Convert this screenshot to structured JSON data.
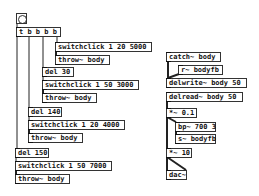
{
  "patch": {
    "bang": {
      "label": "bng"
    },
    "objects": [
      {
        "id": "trigger",
        "text": "t b b b b",
        "x": 16,
        "y": 27,
        "w": 45
      },
      {
        "id": "switchclick1",
        "text": "switchclick 1 20 5000",
        "x": 55,
        "y": 42,
        "w": 97
      },
      {
        "id": "throw1",
        "text": "throw~ body",
        "x": 55,
        "y": 55,
        "w": 55
      },
      {
        "id": "del30",
        "text": "del 30",
        "x": 42,
        "y": 67,
        "w": 32
      },
      {
        "id": "switchclick2",
        "text": "switchclick 1 50 3000",
        "x": 42,
        "y": 80,
        "w": 97
      },
      {
        "id": "throw2",
        "text": "throw~ body",
        "x": 42,
        "y": 93,
        "w": 55
      },
      {
        "id": "del140",
        "text": "del 140",
        "x": 28,
        "y": 107,
        "w": 34
      },
      {
        "id": "switchclick3",
        "text": "switchclick 1 20 4000",
        "x": 28,
        "y": 120,
        "w": 97
      },
      {
        "id": "throw3",
        "text": "throw~ body",
        "x": 28,
        "y": 133,
        "w": 55
      },
      {
        "id": "del150",
        "text": "del 150",
        "x": 15,
        "y": 148,
        "w": 34
      },
      {
        "id": "switchclick4",
        "text": "switchclick 1 50 7000",
        "x": 15,
        "y": 161,
        "w": 97
      },
      {
        "id": "throw4",
        "text": "throw~ body",
        "x": 15,
        "y": 174,
        "w": 55
      },
      {
        "id": "catch",
        "text": "catch~ body",
        "x": 166,
        "y": 52,
        "w": 55
      },
      {
        "id": "rbodyfb",
        "text": "r~ bodyfb",
        "x": 178,
        "y": 65,
        "w": 45
      },
      {
        "id": "delwrite",
        "text": "delwrite~ body 50",
        "x": 166,
        "y": 78,
        "w": 81
      },
      {
        "id": "delread",
        "text": "delread~ body 50",
        "x": 166,
        "y": 92,
        "w": 77
      },
      {
        "id": "mul01",
        "text": "*~ 0.1",
        "x": 166,
        "y": 108,
        "w": 31
      },
      {
        "id": "bp",
        "text": "bp~ 700 3",
        "x": 175,
        "y": 122,
        "w": 41
      },
      {
        "id": "sbodyfb",
        "text": "s~ bodyfb",
        "x": 175,
        "y": 134,
        "w": 41
      },
      {
        "id": "mul10",
        "text": "*~ 10",
        "x": 166,
        "y": 148,
        "w": 26
      },
      {
        "id": "dac",
        "text": "dac~",
        "x": 166,
        "y": 170,
        "w": 21
      }
    ]
  }
}
